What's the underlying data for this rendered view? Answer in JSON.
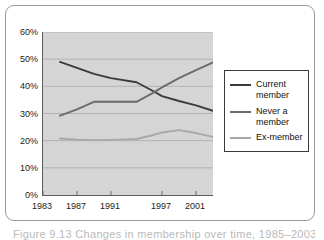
{
  "figure": {
    "caption": "Figure 9.13  Changes in membership over time, 1985–2003"
  },
  "chart_data": {
    "type": "line",
    "title": "",
    "xlabel": "",
    "ylabel": "",
    "xlim": [
      1983,
      2003
    ],
    "ylim": [
      0,
      60
    ],
    "grid": true,
    "grid_axis": "y",
    "legend_position": "right",
    "y_ticks": [
      0,
      10,
      20,
      30,
      40,
      50,
      60
    ],
    "y_tick_labels": [
      "0%",
      "10%",
      "20%",
      "30%",
      "40%",
      "50%",
      "60%"
    ],
    "x_ticks": [
      1983,
      1987,
      1991,
      1997,
      2001
    ],
    "x_tick_labels": [
      "1983",
      "1987",
      "1991",
      "1997",
      "2001"
    ],
    "x": [
      1985,
      1987,
      1989,
      1991,
      1994,
      1996,
      1997,
      1999,
      2001,
      2003
    ],
    "series": [
      {
        "name": "Current member",
        "label": "Current\nmember",
        "color": "#3c3c3c",
        "values": [
          49.0,
          46.8,
          44.6,
          43.0,
          41.5,
          38.2,
          36.4,
          34.6,
          33.0,
          31.0
        ]
      },
      {
        "name": "Never a member",
        "label": "Never a\nmember",
        "color": "#6b6b6b",
        "values": [
          29.2,
          31.5,
          34.3,
          34.3,
          34.3,
          37.7,
          39.6,
          43.0,
          46.0,
          48.8
        ]
      },
      {
        "name": "Ex-member",
        "label": "Ex-member",
        "color": "#a8a8a8",
        "values": [
          20.8,
          20.4,
          20.2,
          20.3,
          20.6,
          22.1,
          23.0,
          23.9,
          22.8,
          21.4
        ]
      }
    ]
  }
}
